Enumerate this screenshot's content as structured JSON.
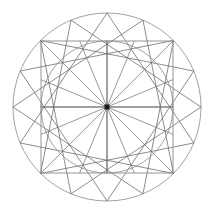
{
  "figure": {
    "kind": "line-drawing",
    "canvas": {
      "width": 212,
      "height": 213,
      "background": "#ffffff"
    },
    "center": {
      "x": 107,
      "y": 107
    },
    "colors": {
      "outer_circle": "#8a8a8a",
      "inner_circle": "#8a8a8a",
      "square": "#8a8a8a",
      "star_polygon": "#6f6f6f",
      "spokes": "#6b6b6b",
      "axes": "#6b6b6b",
      "center_dot": "#1a1a1a"
    },
    "stroke_widths": {
      "outer_circle": 0.8,
      "inner_circle": 0.8,
      "square": 0.9,
      "star_polygon": 0.8,
      "spokes": 0.7,
      "axes": 0.9
    },
    "outer_circle": {
      "cx": 107,
      "cy": 107,
      "r": 94
    },
    "inner_circle": {
      "cx": 107,
      "cy": 107,
      "r": 66
    },
    "square": {
      "x": 41,
      "y": 41,
      "size": 132,
      "half_width": 66
    },
    "center_dot": {
      "cx": 107,
      "cy": 107,
      "size": 5
    },
    "spokes": {
      "count": 16,
      "angle_step_deg": 22.5,
      "start_angle_deg": -90,
      "target": "square-perimeter",
      "description": "16 rays from the center to the inscribed square boundary"
    },
    "star_polygon": {
      "vertex_count": 16,
      "step": 5,
      "schlafli": "{16/5}",
      "radius": 94,
      "start_angle_deg": -90,
      "description": "16-point star polygon inscribed in the outer circle"
    },
    "axes": [
      {
        "name": "vertical-axis",
        "x1": 107,
        "y1": 41,
        "x2": 107,
        "y2": 173
      },
      {
        "name": "horizontal-axis",
        "x1": 41,
        "y1": 107,
        "x2": 173,
        "y2": 107
      }
    ]
  }
}
